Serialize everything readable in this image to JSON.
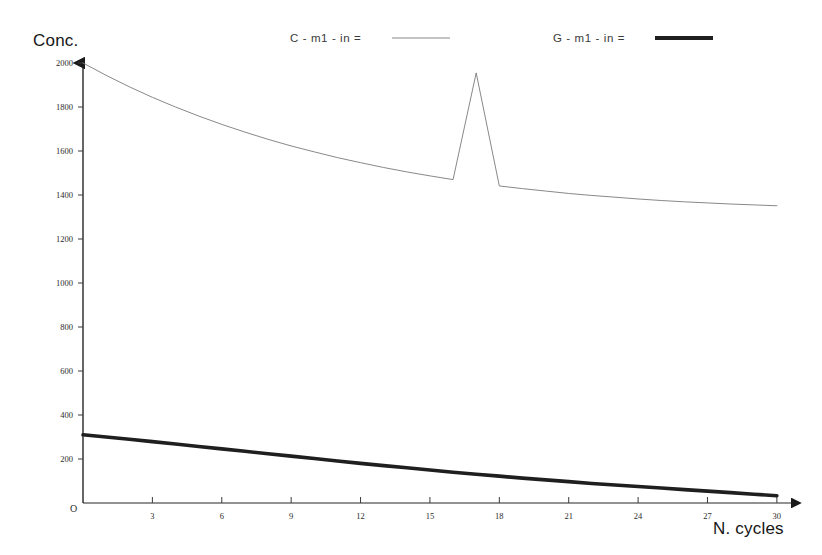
{
  "chart_data": {
    "type": "line",
    "title": "",
    "xlabel": "N. cycles",
    "ylabel": "Conc.",
    "origin_label": "O",
    "xlim": [
      0,
      31
    ],
    "ylim": [
      0,
      2000
    ],
    "grid": false,
    "legend_position": "top",
    "x_ticks": [
      3,
      6,
      9,
      12,
      15,
      18,
      21,
      24,
      27,
      30
    ],
    "x_tick_labels": [
      "3",
      "6",
      "9",
      "12",
      "15",
      "18",
      "21",
      "24",
      "27",
      "30"
    ],
    "y_ticks": [
      200,
      400,
      600,
      800,
      1000,
      1200,
      1400,
      1600,
      1800,
      2000
    ],
    "y_tick_labels": [
      "200",
      "400",
      "600",
      "800",
      "1000",
      "1200",
      "1400",
      "1600",
      "1800",
      "2000"
    ],
    "x": [
      0,
      1,
      2,
      3,
      4,
      5,
      6,
      7,
      8,
      9,
      10,
      11,
      12,
      13,
      14,
      15,
      16,
      17,
      18,
      19,
      20,
      21,
      22,
      23,
      24,
      25,
      26,
      27,
      28,
      29,
      30
    ],
    "series": [
      {
        "name": "C - m1 - in =",
        "style": "thin",
        "color": "#7a7a7a",
        "width": 0.9,
        "values": [
          2000,
          1944,
          1892,
          1844,
          1800,
          1759,
          1721,
          1686,
          1653,
          1623,
          1596,
          1570,
          1547,
          1525,
          1505,
          1487,
          1470,
          1955,
          1441,
          1429,
          1418,
          1407,
          1398,
          1390,
          1382,
          1375,
          1369,
          1364,
          1359,
          1355,
          1351
        ]
      },
      {
        "name": "G - m1 - in =",
        "style": "thick",
        "color": "#1f1f1f",
        "width": 3.6,
        "values": [
          310,
          300,
          290,
          279,
          268,
          257,
          246,
          235,
          224,
          213,
          202,
          191,
          180,
          170,
          160,
          150,
          140,
          131,
          122,
          113,
          105,
          97,
          89,
          82,
          75,
          68,
          61,
          54,
          47,
          40,
          33
        ]
      }
    ],
    "legend": [
      {
        "label": "C - m1 - in =",
        "style": "thin",
        "color": "#7a7a7a"
      },
      {
        "label": "G - m1 - in =",
        "style": "thick",
        "color": "#1f1f1f"
      }
    ]
  }
}
